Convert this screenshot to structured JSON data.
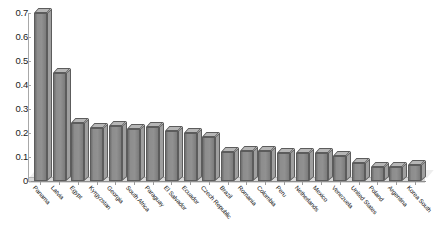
{
  "chart_data": {
    "type": "bar",
    "title": "",
    "subtitle": "",
    "xlabel": "",
    "ylabel": "",
    "ylim": [
      0,
      0.7
    ],
    "yticks": [
      "0",
      "0.1",
      "0.2",
      "0.3",
      "0.4",
      "0.5",
      "0.6",
      "0.7"
    ],
    "ytick_values": [
      0,
      0.1,
      0.2,
      0.3,
      0.4,
      0.5,
      0.6,
      0.7
    ],
    "grid": false,
    "legend": "none",
    "style": "3d-column",
    "bar_color": "#8d8d8d",
    "bar_top_color": "#b6b6b6",
    "bar_edge_color": "#5c5c5c",
    "background_color": "#ffffff",
    "axis_color": "#a8a8a8",
    "categories": [
      "Panama",
      "Latvia",
      "Egypt",
      "Kyrgyzstan",
      "Georgia",
      "South Africa",
      "Paraguay",
      "El Salvador",
      "Ecuador",
      "Czech Republic",
      "Brazil",
      "Romania",
      "Colombia",
      "Peru",
      "Netherlands",
      "Mexico",
      "Venezuela",
      "United States",
      "Poland",
      "Argentina",
      "Korea South"
    ],
    "values": [
      0.7,
      0.45,
      0.24,
      0.22,
      0.23,
      0.215,
      0.225,
      0.21,
      0.2,
      0.185,
      0.12,
      0.125,
      0.125,
      0.115,
      0.115,
      0.115,
      0.105,
      0.075,
      0.06,
      0.06,
      0.065
    ]
  }
}
